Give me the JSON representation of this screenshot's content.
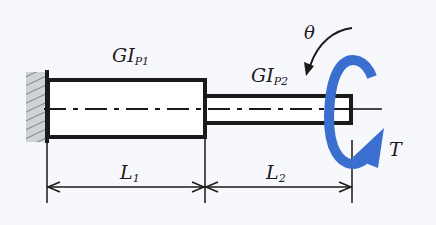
{
  "labels": {
    "gi1_main": "GI",
    "gi1_sub": "P1",
    "gi2_main": "GI",
    "gi2_sub": "P2",
    "theta": "θ",
    "torque": "T",
    "l1_main": "L",
    "l1_sub": "1",
    "l2_main": "L",
    "l2_sub": "2"
  },
  "colors": {
    "line": "#1a1a1a",
    "torque_arrow": "#3a6fd0",
    "wall_hatch_fill": "#cfd2d6",
    "background": "#f6f8fb"
  },
  "geometry": {
    "wall": {
      "x": 26,
      "y": 72,
      "w": 20,
      "h": 70
    },
    "shaft1": {
      "x": 47,
      "y": 79,
      "w": 158,
      "h": 59
    },
    "shaft2": {
      "x": 205,
      "y": 95,
      "w": 147,
      "h": 29
    },
    "centerline_y": 109,
    "dimension_y": 187
  }
}
